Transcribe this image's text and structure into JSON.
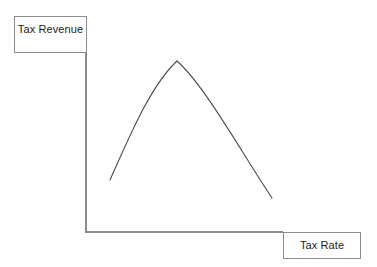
{
  "diagram": {
    "background_color": "#ffffff",
    "axis_color": "#8c8c8c",
    "curve_color": "#4a4a4a",
    "box_border_color": "#8c8c8c",
    "text_color": "#1a1a1a",
    "y_axis": {
      "label": "Tax Revenue",
      "box": {
        "x": 14,
        "y": 16,
        "width": 73,
        "height": 37
      },
      "line": {
        "x1": 86,
        "y1": 52,
        "x2": 86,
        "y2": 232
      }
    },
    "x_axis": {
      "label": "Tax Rate",
      "box": {
        "x": 283,
        "y": 232,
        "width": 78,
        "height": 27
      },
      "line": {
        "x1": 86,
        "y1": 232,
        "x2": 283,
        "y2": 232
      }
    }
  },
  "chart_data": {
    "type": "line",
    "xlabel": "Tax Rate",
    "ylabel": "Tax Revenue",
    "grid": false,
    "legend": "none",
    "axis_ticks": [],
    "xlim": [
      0,
      100
    ],
    "ylim": [
      0,
      100
    ],
    "series": [
      {
        "name": "Tax Revenue vs Tax Rate",
        "shape": "inverted-u",
        "x": [
          12,
          20,
          30,
          40,
          46,
          55,
          65,
          75,
          85,
          95
        ],
        "y": [
          29,
          47,
          69,
          85,
          88,
          83,
          68,
          50,
          32,
          17
        ],
        "peak": {
          "x": 46,
          "y": 88
        },
        "start_point": {
          "x": 12,
          "y": 29
        },
        "end_point": {
          "x": 95,
          "y": 17
        },
        "pixel_path": "M 110,180 C 128,140 150,86 177,61 C 205,86 240,150 272,198",
        "pixel_points": {
          "start": [
            110,
            180
          ],
          "peak": [
            177,
            61
          ],
          "end": [
            272,
            198
          ]
        }
      }
    ]
  }
}
